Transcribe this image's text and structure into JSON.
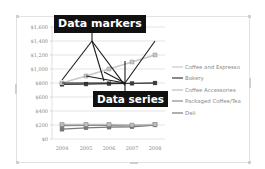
{
  "callouts": {
    "markers_label": "Data markers",
    "series_label": "Data series"
  },
  "colors": {
    "callout_bg": "#111111",
    "callout_text": "#ffffff",
    "gridline": "#d9d9d9",
    "axis_text": "#8a8a8a"
  },
  "chart_data": {
    "type": "line",
    "title": "",
    "xlabel": "",
    "ylabel": "",
    "categories": [
      "2004",
      "2005",
      "2006",
      "2007",
      "2008"
    ],
    "ylim": [
      0,
      1600
    ],
    "yticks": [
      "$0",
      "$200",
      "$400",
      "$600",
      "$800",
      "$1,000",
      "$1,200",
      "$1,400",
      "$1,600"
    ],
    "grid": true,
    "legend_position": "right",
    "series": [
      {
        "name": "Coffee and Espresso",
        "color": "#c8c8c8",
        "values": [
          800,
          900,
          1000,
          1100,
          1200
        ]
      },
      {
        "name": "Bakery",
        "color": "#3a3a3a",
        "values": [
          780,
          785,
          790,
          795,
          800
        ]
      },
      {
        "name": "Coffee Accessories",
        "color": "#bdbdbd",
        "values": [
          210,
          210,
          210,
          200,
          210
        ]
      },
      {
        "name": "Packaged Coffee/Tea",
        "color": "#8c8c8c",
        "values": [
          190,
          195,
          200,
          195,
          205
        ]
      },
      {
        "name": "Deli",
        "color": "#7a7a7a",
        "values": [
          140,
          160,
          170,
          175,
          200
        ]
      }
    ],
    "annotations": [
      "Data markers",
      "Data series"
    ]
  }
}
